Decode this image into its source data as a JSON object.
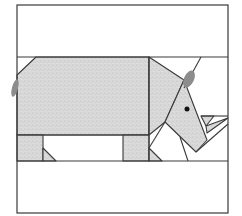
{
  "diagram": {
    "title": "Rhinoceros quilt block pattern",
    "colors": {
      "background": "#ffffff",
      "outline": "#3a3a3a",
      "fabric": "#d9d9d9",
      "fabric_speckle": "#bdbdbd",
      "tail_ear": "#8c8c8c",
      "eye": "#111111"
    },
    "frame": {
      "x": 17,
      "y": 5,
      "width": 211,
      "height": 208
    },
    "rows": {
      "top_band_bottom_y": 57,
      "body_bottom_y": 135,
      "legs_bottom_y": 161
    },
    "pieces": [
      {
        "name": "body",
        "points": "17,75 36,57 149,57 149,135 17,135"
      },
      {
        "name": "head-neck",
        "points": "149,57 184,80 165,122 149,135"
      },
      {
        "name": "face",
        "points": "184,80 207,140 196,152 165,122"
      },
      {
        "name": "leg-left",
        "points": "17,135 43,135 43,161 17,161"
      },
      {
        "name": "leg-left-triangle",
        "points": "43,148 56,161 43,161"
      },
      {
        "name": "leg-right",
        "points": "123,135 149,135 149,161 123,161"
      },
      {
        "name": "leg-right-triangle",
        "points": "149,148 162,161 149,161"
      },
      {
        "name": "horn",
        "points": "201,116 214,116 206,126"
      },
      {
        "name": "horn-small",
        "points": "206,126 228,118 207,133"
      }
    ],
    "lines": [
      {
        "name": "head-top-line",
        "x1": 184,
        "y1": 88,
        "x2": 201,
        "y2": 57
      },
      {
        "name": "right-panel-line",
        "x1": 201,
        "y1": 116,
        "x2": 228,
        "y2": 116
      },
      {
        "name": "chin-line",
        "x1": 165,
        "y1": 122,
        "x2": 149,
        "y2": 148
      },
      {
        "name": "jaw-line",
        "x1": 196,
        "y1": 152,
        "x2": 228,
        "y2": 124
      },
      {
        "name": "throat-line",
        "x1": 180,
        "y1": 137,
        "x2": 188,
        "y2": 161
      }
    ],
    "tail": {
      "cx": 15,
      "cy": 88,
      "rx": 3,
      "ry": 9
    },
    "ear": {
      "cx": 189,
      "cy": 79,
      "rx": 5,
      "ry": 9
    },
    "eye": {
      "cx": 187,
      "cy": 109,
      "r": 2.5
    }
  }
}
